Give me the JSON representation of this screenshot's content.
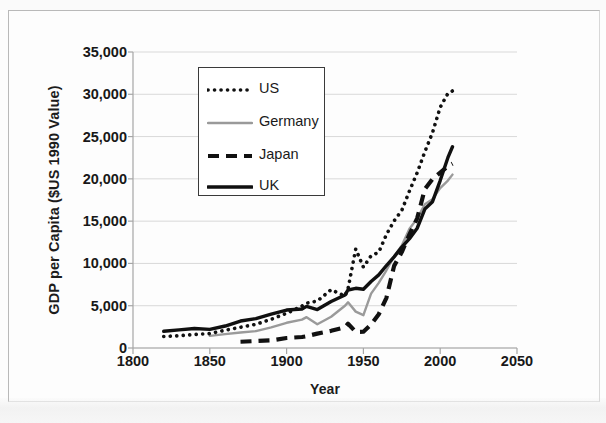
{
  "chart_data": {
    "type": "line",
    "title": "",
    "xlabel": "Year",
    "ylabel": "GDP per Capita ($US 1990 Value)",
    "xlim": [
      1800,
      2050
    ],
    "ylim": [
      0,
      35000
    ],
    "xticks": [
      "1800",
      "1850",
      "1900",
      "1950",
      "2000",
      "2050"
    ],
    "yticks": [
      "0",
      "5,000",
      "10,000",
      "15,000",
      "20,000",
      "25,000",
      "30,000",
      "35,000"
    ],
    "grid": "horizontal",
    "legend_position": "upper-left-inside",
    "series": [
      {
        "name": "US",
        "style": "dotted",
        "color": "#111111",
        "x": [
          1820,
          1830,
          1840,
          1850,
          1860,
          1870,
          1880,
          1890,
          1900,
          1910,
          1913,
          1920,
          1929,
          1938,
          1940,
          1945,
          1950,
          1955,
          1960,
          1965,
          1970,
          1975,
          1980,
          1985,
          1990,
          1995,
          2000,
          2005,
          2008
        ],
        "values": [
          1360,
          1450,
          1600,
          1700,
          2100,
          2450,
          2800,
          3400,
          4100,
          4960,
          5300,
          5550,
          6900,
          6130,
          7010,
          11700,
          9560,
          10900,
          11330,
          13420,
          15030,
          16280,
          18580,
          20720,
          23200,
          25470,
          28460,
          30100,
          30400
        ]
      },
      {
        "name": "Germany",
        "style": "solid-thin",
        "color": "#9a9a9a",
        "x": [
          1850,
          1860,
          1870,
          1880,
          1890,
          1900,
          1910,
          1913,
          1920,
          1929,
          1938,
          1940,
          1945,
          1950,
          1955,
          1960,
          1965,
          1970,
          1975,
          1980,
          1985,
          1990,
          1995,
          2000,
          2005,
          2008
        ],
        "values": [
          1430,
          1640,
          1840,
          1990,
          2430,
          2980,
          3350,
          3650,
          2800,
          3700,
          4990,
          5400,
          4300,
          3880,
          6430,
          7700,
          9190,
          10840,
          12130,
          14110,
          15300,
          17000,
          17600,
          18900,
          19800,
          20500
        ]
      },
      {
        "name": "Japan",
        "style": "dashed",
        "color": "#111111",
        "x": [
          1870,
          1880,
          1890,
          1900,
          1910,
          1913,
          1920,
          1929,
          1938,
          1940,
          1945,
          1950,
          1955,
          1960,
          1965,
          1970,
          1975,
          1980,
          1985,
          1990,
          1995,
          2000,
          2005,
          2008
        ],
        "values": [
          740,
          820,
          900,
          1180,
          1300,
          1390,
          1700,
          2030,
          2450,
          2870,
          1900,
          1920,
          2770,
          3990,
          5930,
          9710,
          11340,
          13430,
          15330,
          18790,
          19980,
          20740,
          21500,
          21800
        ]
      },
      {
        "name": "UK",
        "style": "solid-thick",
        "color": "#101010",
        "x": [
          1820,
          1830,
          1840,
          1850,
          1860,
          1870,
          1880,
          1890,
          1900,
          1910,
          1913,
          1920,
          1929,
          1938,
          1940,
          1945,
          1950,
          1955,
          1960,
          1965,
          1970,
          1975,
          1980,
          1985,
          1990,
          1995,
          2000,
          2005,
          2008
        ],
        "values": [
          1980,
          2140,
          2310,
          2200,
          2600,
          3190,
          3480,
          4010,
          4490,
          4610,
          4920,
          4550,
          5500,
          6270,
          6860,
          7060,
          6940,
          7870,
          8650,
          9750,
          10770,
          11930,
          12930,
          14160,
          16430,
          17300,
          19800,
          22500,
          23800
        ]
      }
    ]
  },
  "legend": {
    "items": [
      {
        "label": "US",
        "marker": "dotted-line-swatch"
      },
      {
        "label": "Germany",
        "marker": "thin-gray-line-swatch"
      },
      {
        "label": "Japan",
        "marker": "dashed-line-swatch"
      },
      {
        "label": "UK",
        "marker": "thick-black-line-swatch"
      }
    ]
  },
  "colors": {
    "gridline": "#d9d9d9",
    "axis": "#a6a6a6",
    "text": "#181818",
    "germany": "#9a9a9a",
    "ink": "#111111",
    "page_border": "#b9b9b9"
  }
}
